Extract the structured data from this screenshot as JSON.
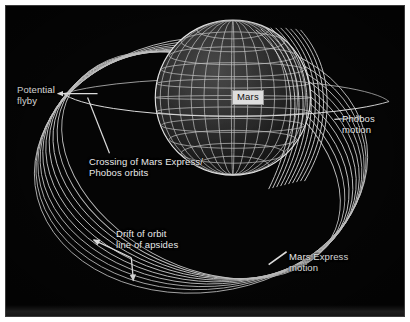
{
  "figure": {
    "background_color": "#050505",
    "line_color": "#d8d8d8",
    "text_color": "#e9e9e9",
    "frame_color": "#ffffff"
  },
  "planet": {
    "name": "Mars",
    "label": "Mars",
    "label_bg": "#dedede",
    "label_text_color": "#111111",
    "style": "wireframe-globe"
  },
  "labels": {
    "potential_flyby": "Potential\nflyby",
    "crossing": "Crossing of Mars Express/\nPhobos orbits",
    "drift": "Drift of orbit\nline of apsides",
    "phobos_motion": "Phobos\nmotion",
    "mars_express_motion": "Mars Express\nmotion"
  },
  "annotations": [
    {
      "name": "potential-flyby",
      "text": "Potential flyby",
      "pointer": "arrow-left",
      "target": "orbit-crossing-region"
    },
    {
      "name": "crossing-of-orbits",
      "text": "Crossing of Mars Express/ Phobos orbits",
      "pointer": "leader-line-up-left",
      "target": "orbit-crossing-region"
    },
    {
      "name": "drift-of-apsides",
      "text": "Drift of orbit line of apsides",
      "pointer": "double-arrow",
      "target": "orbit-family-lower-left"
    },
    {
      "name": "phobos-motion",
      "text": "Phobos motion",
      "pointer": "arrow-on-orbit",
      "target": "phobos-orbit-right"
    },
    {
      "name": "mars-express-motion",
      "text": "Mars Express motion",
      "pointer": "tick-line",
      "target": "orbit-family-lower-right"
    }
  ],
  "orbits": {
    "mars_express": {
      "name": "Mars Express orbit family",
      "count": 10,
      "description": "nested precessing ellipses",
      "direction": "Mars Express motion"
    },
    "phobos": {
      "name": "Phobos orbit",
      "count": 1,
      "description": "near edge-on circular orbit ring",
      "direction": "Phobos motion"
    }
  }
}
